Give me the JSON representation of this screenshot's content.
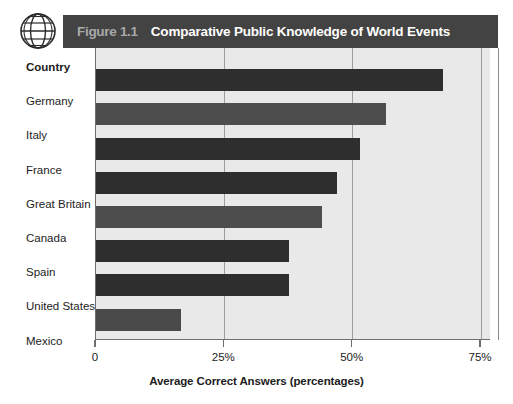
{
  "figure": {
    "number_label": "Figure 1.1",
    "title": "Comparative Public Knowledge of World Events",
    "icon": "globe-icon",
    "banner_color": "#434343",
    "number_color": "#a9a9a9",
    "title_color": "#ffffff",
    "plot_background": "#e9e9e9"
  },
  "axis": {
    "category_header": "Country",
    "x_title": "Average Correct Answers (percentages)",
    "x_ticks": [
      "0",
      "25%",
      "50%",
      "75%"
    ],
    "x_tick_values": [
      0,
      25,
      50,
      75
    ]
  },
  "chart_data": {
    "type": "bar",
    "orientation": "horizontal",
    "title": "Comparative Public Knowledge of World Events",
    "xlabel": "Average Correct Answers (percentages)",
    "ylabel": "Country",
    "xlim": [
      0,
      75
    ],
    "grid": true,
    "legend": "none",
    "categories": [
      "Germany",
      "Italy",
      "France",
      "Great Britain",
      "Canada",
      "Spain",
      "United States",
      "Mexico"
    ],
    "values": [
      67.5,
      56.5,
      51.5,
      47,
      44,
      37.5,
      37.5,
      16.5
    ],
    "bar_colors": [
      "#2e2e2e",
      "#4d4d4d",
      "#2e2e2e",
      "#2e2e2e",
      "#4d4d4d",
      "#2e2e2e",
      "#2e2e2e",
      "#4a4a4a"
    ]
  }
}
